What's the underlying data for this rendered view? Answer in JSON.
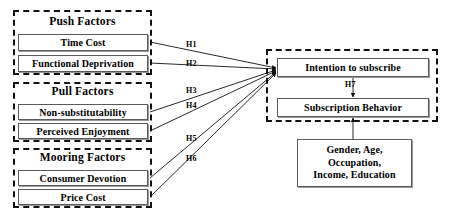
{
  "diagram": {
    "groups": [
      {
        "id": "push",
        "label": "Push Factors",
        "x": 13,
        "y": 10,
        "w": 139,
        "h": 65,
        "title_y": 15,
        "nodes": [
          {
            "label": "Time Cost",
            "x": 18,
            "y": 34,
            "w": 130,
            "h": 17
          },
          {
            "label": "Functional Deprivation",
            "x": 18,
            "y": 55,
            "w": 130,
            "h": 17
          }
        ]
      },
      {
        "id": "pull",
        "label": "Pull Factors",
        "x": 13,
        "y": 82,
        "w": 139,
        "h": 60,
        "title_y": 85,
        "nodes": [
          {
            "label": "Non-substitutability",
            "x": 18,
            "y": 104,
            "w": 130,
            "h": 16
          },
          {
            "label": "Perceived Enjoyment",
            "x": 18,
            "y": 123,
            "w": 130,
            "h": 16
          }
        ]
      },
      {
        "id": "mooring",
        "label": "Mooring Factors",
        "x": 13,
        "y": 148,
        "w": 139,
        "h": 60,
        "title_y": 151,
        "nodes": [
          {
            "label": "Consumer Devotion",
            "x": 18,
            "y": 170,
            "w": 130,
            "h": 16
          },
          {
            "label": "Price Cost",
            "x": 18,
            "y": 189,
            "w": 130,
            "h": 16
          }
        ]
      }
    ],
    "outcome_group": {
      "id": "outcome",
      "x": 266,
      "y": 49,
      "w": 172,
      "h": 73,
      "nodes": [
        {
          "id": "intention",
          "label": "Intention to subscribe",
          "x": 277,
          "y": 58,
          "w": 152,
          "h": 19
        },
        {
          "id": "behavior",
          "label": "Subscription Behavior",
          "x": 277,
          "y": 98,
          "w": 152,
          "h": 19
        }
      ]
    },
    "controls": {
      "id": "control-variables",
      "x": 297,
      "y": 139,
      "w": 115,
      "h": 48,
      "lines": [
        "Gender, Age,",
        "Occupation,",
        "Income, Education"
      ]
    },
    "hypotheses": [
      {
        "id": "H1",
        "label": "H1",
        "x": 186,
        "y": 40,
        "from_x": 150,
        "from_y": 42,
        "to_x": 276,
        "to_y": 68
      },
      {
        "id": "H2",
        "label": "H2",
        "x": 186,
        "y": 59,
        "from_x": 150,
        "from_y": 63,
        "to_x": 276,
        "to_y": 69
      },
      {
        "id": "H3",
        "label": "H3",
        "x": 186,
        "y": 86,
        "from_x": 150,
        "from_y": 112,
        "to_x": 276,
        "to_y": 70
      },
      {
        "id": "H4",
        "label": "H4",
        "x": 186,
        "y": 101,
        "from_x": 150,
        "from_y": 131,
        "to_x": 276,
        "to_y": 71
      },
      {
        "id": "H5",
        "label": "H5",
        "x": 186,
        "y": 134,
        "from_x": 150,
        "from_y": 178,
        "to_x": 276,
        "to_y": 72
      },
      {
        "id": "H6",
        "label": "H6",
        "x": 186,
        "y": 154,
        "from_x": 150,
        "from_y": 197,
        "to_x": 276,
        "to_y": 73
      },
      {
        "id": "H7",
        "label": "H7",
        "x": 345,
        "y": 80,
        "from_x": 353,
        "from_y": 78,
        "to_x": 353,
        "to_y": 97
      }
    ],
    "control_link": {
      "from_x": 353,
      "from_y": 139,
      "to_x": 353,
      "to_y": 118
    },
    "colors": {
      "stroke": "#111111",
      "node_border": "#5a5a5a",
      "node_shadow": "#9a9a9a",
      "text": "#000000",
      "background": "#ffffff"
    }
  }
}
